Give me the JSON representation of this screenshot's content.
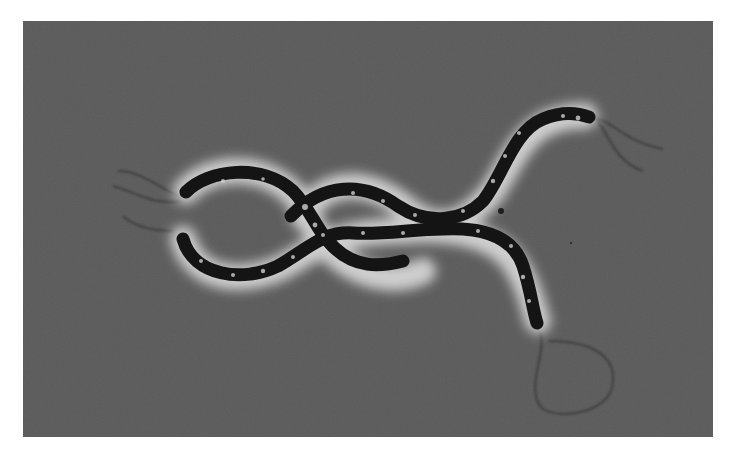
{
  "image": {
    "subject": "phase-contrast micrograph of two spiral bacteria with flagella",
    "background_color": "#5b5b5b",
    "cell_color": "#161616",
    "halo_color": "#e8e8e8",
    "flagella_color": "#3a3a3a"
  },
  "organisms": [
    {
      "label": "spirillum-upper",
      "description": "upper helical cell, flagella at right end"
    },
    {
      "label": "spirillum-lower",
      "description": "lower helical cell, flagellum loop at bottom end"
    }
  ]
}
